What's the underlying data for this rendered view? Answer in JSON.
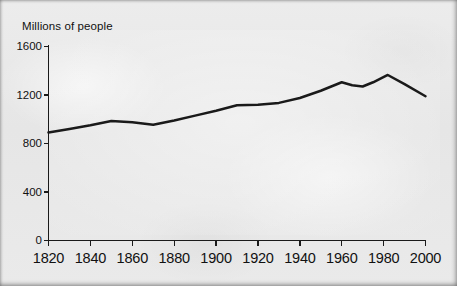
{
  "chart_data": {
    "type": "line",
    "title": "",
    "subtitle": "",
    "xlabel": "",
    "ylabel": "Millions of people",
    "xlim": [
      1820,
      2000
    ],
    "ylim": [
      0,
      1600
    ],
    "grid": false,
    "legend": null,
    "x_ticks": [
      1820,
      1840,
      1860,
      1880,
      1900,
      1920,
      1940,
      1960,
      1980,
      2000
    ],
    "x_tick_labels": [
      "1820",
      "1840",
      "1860",
      "1880",
      "1900",
      "1920",
      "1940",
      "1960",
      "1980",
      "2000"
    ],
    "y_ticks": [
      0,
      400,
      800,
      1200,
      1600
    ],
    "y_tick_labels": [
      "0",
      "400",
      "800",
      "1200",
      "1600"
    ],
    "line_color": "#1a1a1a",
    "series": [
      {
        "name": "Millions of people",
        "x": [
          1820,
          1830,
          1840,
          1850,
          1860,
          1870,
          1880,
          1890,
          1900,
          1910,
          1920,
          1930,
          1940,
          1950,
          1960,
          1965,
          1970,
          1975,
          1982,
          1990,
          2000
        ],
        "values": [
          890,
          920,
          950,
          985,
          975,
          955,
          990,
          1030,
          1070,
          1115,
          1120,
          1135,
          1175,
          1235,
          1305,
          1280,
          1270,
          1305,
          1365,
          1290,
          1190
        ]
      }
    ],
    "annotations": []
  },
  "figure": {
    "axis_title": "Millions of people",
    "background_color": "#e9e9e9",
    "ink_color": "#1a1a1a"
  }
}
